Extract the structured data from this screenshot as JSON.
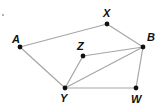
{
  "diagram": {
    "type": "graph",
    "stray_dot": {
      "x": 3,
      "y": 15
    },
    "nodes": [
      {
        "id": "A",
        "label": "A",
        "x": 20,
        "y": 47,
        "lx": 12,
        "ly": 43
      },
      {
        "id": "X",
        "label": "X",
        "x": 107,
        "y": 24,
        "lx": 103,
        "ly": 17
      },
      {
        "id": "B",
        "label": "B",
        "x": 143,
        "y": 47,
        "lx": 147,
        "ly": 41
      },
      {
        "id": "Z",
        "label": "Z",
        "x": 83,
        "y": 56,
        "lx": 77,
        "ly": 50
      },
      {
        "id": "Y",
        "label": "Y",
        "x": 65,
        "y": 88,
        "lx": 60,
        "ly": 102
      },
      {
        "id": "W",
        "label": "W",
        "x": 136,
        "y": 88,
        "lx": 131,
        "ly": 103
      }
    ],
    "edges": [
      [
        "A",
        "X"
      ],
      [
        "X",
        "B"
      ],
      [
        "A",
        "Y"
      ],
      [
        "Z",
        "Y"
      ],
      [
        "Z",
        "B"
      ],
      [
        "Y",
        "B"
      ],
      [
        "Y",
        "W"
      ],
      [
        "W",
        "B"
      ]
    ],
    "colors": {
      "edge": "#a6a6a6",
      "node": "#111111",
      "label": "#111111"
    }
  }
}
